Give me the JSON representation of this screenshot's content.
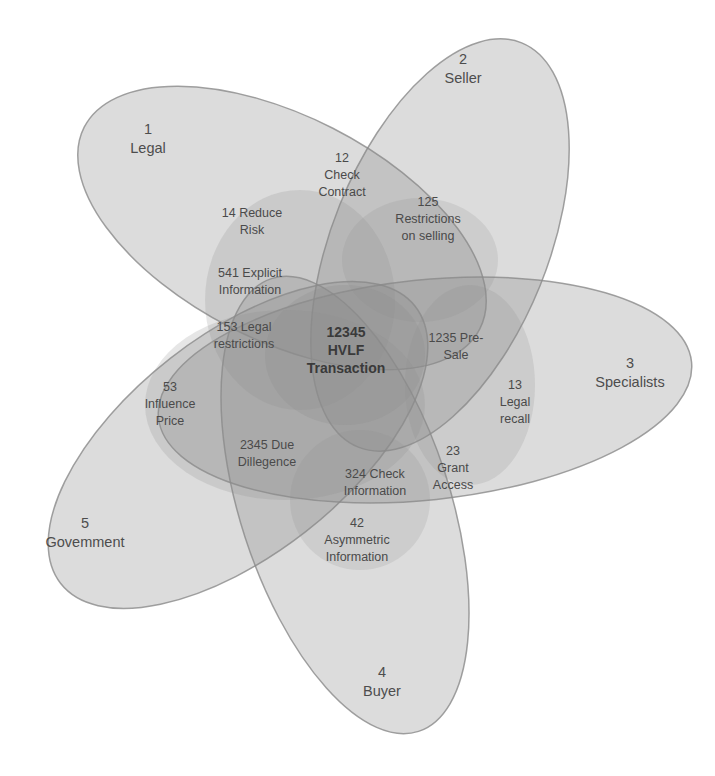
{
  "diagram": {
    "type": "venn",
    "set_count": 5,
    "sets": [
      {
        "id": 1,
        "number": "1",
        "name": "Legal"
      },
      {
        "id": 2,
        "number": "2",
        "name": "Seller"
      },
      {
        "id": 3,
        "number": "3",
        "name": "Specialists"
      },
      {
        "id": 4,
        "number": "4",
        "name": "Buyer"
      },
      {
        "id": 5,
        "number": "5",
        "name": "Govemment"
      }
    ],
    "regions": {
      "check_contract": {
        "line1": "12",
        "line2": "Check",
        "line3": "Contract"
      },
      "reduce_risk": {
        "line1": "14 Reduce",
        "line2": "Risk"
      },
      "restrictions_selling": {
        "line1": "125",
        "line2": "Restrictions",
        "line3": "on selling"
      },
      "explicit_information": {
        "line1": "541 Explicit",
        "line2": "Information"
      },
      "legal_restrictions": {
        "line1": "153 Legal",
        "line2": "restrictions"
      },
      "hvlf_transaction": {
        "line1": "12345",
        "line2": "HVLF",
        "line3": "Transaction"
      },
      "pre_sale": {
        "line1": "1235 Pre-",
        "line2": "Sale"
      },
      "legal_recall": {
        "line1": "13",
        "line2": "Legal",
        "line3": "recall"
      },
      "influence_price": {
        "line1": "53",
        "line2": "Influence",
        "line3": "Price"
      },
      "due_diligence": {
        "line1": "2345 Due",
        "line2": "Dillegence"
      },
      "grant_access": {
        "line1": "23",
        "line2": "Grant",
        "line3": "Access"
      },
      "check_information": {
        "line1": "324 Check",
        "line2": "Information"
      },
      "asymmetric_information": {
        "line1": "42",
        "line2": "Asymmetric",
        "line3": "Information"
      }
    }
  }
}
